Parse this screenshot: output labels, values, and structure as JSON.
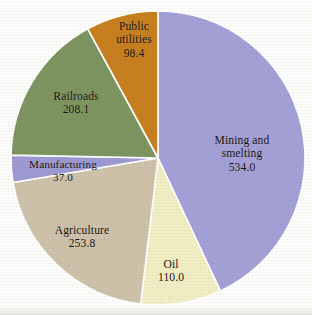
{
  "chart_data": {
    "type": "pie",
    "title": "",
    "subtitle": "",
    "xlabel": "",
    "ylabel": "",
    "legend_position": "none",
    "labels_inside_slices": true,
    "start_angle_deg": 0,
    "direction": "clockwise",
    "total": 1241.3,
    "categories": [
      "Mining and smelting",
      "Oil",
      "Agriculture",
      "Manufacturing",
      "Railroads",
      "Public utilities"
    ],
    "values": [
      534.0,
      110.0,
      253.8,
      37.0,
      208.1,
      98.4
    ],
    "value_labels": [
      "534.0",
      "110.0",
      "253.8",
      "37.0",
      "208.1",
      "98.4"
    ],
    "colors": [
      "#a3a1d7",
      "#f2eec4",
      "#cfc2ab",
      "#9d9bd2",
      "#7d9560",
      "#c8801f"
    ],
    "slices": [
      {
        "name": "Mining and smelting",
        "label_line1": "Mining and",
        "label_line2": "smelting",
        "value": 534.0,
        "value_label": "534.0",
        "percent": 43.0,
        "angle_deg": 154.9,
        "color": "#a3a1d7"
      },
      {
        "name": "Oil",
        "label_line1": "Oil",
        "label_line2": "",
        "value": 110.0,
        "value_label": "110.0",
        "percent": 8.9,
        "angle_deg": 31.9,
        "color": "#f2eec4"
      },
      {
        "name": "Agriculture",
        "label_line1": "Agriculture",
        "label_line2": "",
        "value": 253.8,
        "value_label": "253.8",
        "percent": 20.4,
        "angle_deg": 73.6,
        "color": "#cfc2ab"
      },
      {
        "name": "Manufacturing",
        "label_line1": "Manufacturing",
        "label_line2": "",
        "value": 37.0,
        "value_label": "37.0",
        "percent": 3.0,
        "angle_deg": 10.7,
        "color": "#9d9bd2"
      },
      {
        "name": "Railroads",
        "label_line1": "Railroads",
        "label_line2": "",
        "value": 208.1,
        "value_label": "208.1",
        "percent": 16.8,
        "angle_deg": 60.4,
        "color": "#7d9560"
      },
      {
        "name": "Public utilities",
        "label_line1": "Public",
        "label_line2": "utilities",
        "value": 98.4,
        "value_label": "98.4",
        "percent": 7.9,
        "angle_deg": 28.5,
        "color": "#c8801f"
      }
    ]
  },
  "figure": {
    "background_color": "#fdfdfb",
    "slice_separator_color": "#ffffff",
    "label_text_color": "#1a1410"
  }
}
